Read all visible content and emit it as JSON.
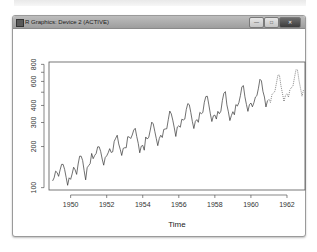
{
  "window": {
    "title": "R Graphics: Device 2 (ACTIVE)",
    "controls": {
      "minimize": "—",
      "maximize": "□",
      "close": "✕"
    },
    "icon": "r-graphics-icon"
  },
  "chart_data": {
    "type": "line",
    "title": "",
    "xlabel": "Time",
    "ylabel": "",
    "y_scale": "log",
    "xlim": [
      1949,
      1963
    ],
    "ylim": [
      100,
      800
    ],
    "x_ticks": [
      "1950",
      "1952",
      "1954",
      "1956",
      "1958",
      "1960",
      "1962"
    ],
    "y_ticks": [
      "100",
      "200",
      "300",
      "400",
      "600",
      "800"
    ],
    "grid": false,
    "legend": null,
    "series": [
      {
        "name": "observed",
        "style": "solid",
        "start": 1949,
        "frequency": 12,
        "values": [
          112,
          118,
          132,
          129,
          121,
          135,
          148,
          148,
          136,
          119,
          104,
          118,
          115,
          126,
          141,
          135,
          125,
          149,
          170,
          170,
          158,
          133,
          114,
          140,
          145,
          150,
          178,
          163,
          172,
          178,
          199,
          199,
          184,
          162,
          146,
          166,
          171,
          180,
          193,
          181,
          183,
          218,
          230,
          242,
          209,
          191,
          172,
          194,
          196,
          196,
          236,
          235,
          229,
          243,
          264,
          272,
          237,
          211,
          180,
          201,
          204,
          188,
          235,
          227,
          234,
          264,
          302,
          293,
          259,
          229,
          203,
          229,
          242,
          233,
          267,
          269,
          270,
          315,
          364,
          347,
          312,
          274,
          237,
          278,
          284,
          277,
          317,
          313,
          318,
          374,
          413,
          405,
          355,
          306,
          271,
          306,
          315,
          301,
          356,
          348,
          355,
          422,
          465,
          467,
          404,
          347,
          305,
          336,
          340,
          318,
          362,
          348,
          363,
          435,
          491,
          505,
          404,
          359,
          310,
          337,
          360,
          342,
          406,
          396,
          420,
          472,
          548,
          559,
          463,
          407,
          362,
          405,
          417,
          391,
          419,
          461,
          472,
          535,
          622,
          606,
          508,
          461,
          390,
          432
        ]
      },
      {
        "name": "forecast",
        "style": "dotted",
        "start": 1961,
        "frequency": 12,
        "values": [
          446,
          420,
          480,
          494,
          509,
          585,
          669,
          666,
          557,
          490,
          428,
          475,
          487,
          460,
          525,
          540,
          557,
          640,
          732,
          728,
          610,
          536,
          468,
          520
        ]
      }
    ]
  }
}
